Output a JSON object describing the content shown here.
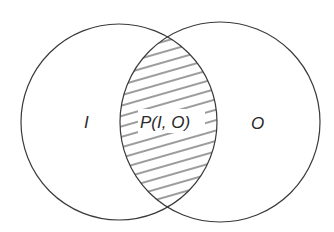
{
  "diagram": {
    "type": "venn",
    "sets": [
      {
        "label": "I"
      },
      {
        "label": "O"
      }
    ],
    "intersection": {
      "label": "P(I, O)",
      "fill": "hatched"
    },
    "colors": {
      "stroke": "#3a3a3a",
      "background": "#ffffff"
    }
  }
}
